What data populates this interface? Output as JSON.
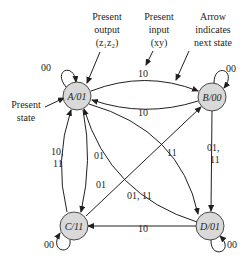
{
  "diagram": {
    "type": "state-diagram",
    "nodes": [
      {
        "id": "A",
        "label": "A/01",
        "state": "A",
        "output": "01"
      },
      {
        "id": "B",
        "label": "B/00",
        "state": "B",
        "output": "00"
      },
      {
        "id": "C",
        "label": "C/11",
        "state": "C",
        "output": "11"
      },
      {
        "id": "D",
        "label": "D/01",
        "state": "D",
        "output": "01"
      }
    ],
    "edges": [
      {
        "from": "A",
        "to": "A",
        "label": "00"
      },
      {
        "from": "A",
        "to": "B",
        "label": "10"
      },
      {
        "from": "B",
        "to": "A",
        "label": "10"
      },
      {
        "from": "B",
        "to": "B",
        "label": "00"
      },
      {
        "from": "B",
        "to": "D",
        "label": "01, 11"
      },
      {
        "from": "A",
        "to": "D",
        "label": "11"
      },
      {
        "from": "D",
        "to": "A",
        "label": "01, 11"
      },
      {
        "from": "A",
        "to": "C",
        "label": "01"
      },
      {
        "from": "C",
        "to": "A",
        "label": "10, 11"
      },
      {
        "from": "C",
        "to": "B",
        "label": "01"
      },
      {
        "from": "C",
        "to": "C",
        "label": "00"
      },
      {
        "from": "D",
        "to": "C",
        "label": "10"
      },
      {
        "from": "D",
        "to": "D",
        "label": "00"
      }
    ],
    "annotations": {
      "present_output": [
        "Present",
        "output",
        "(z₁z₂)"
      ],
      "present_input": [
        "Present",
        "input",
        "(xy)"
      ],
      "arrow_note": [
        "Arrow",
        "indicates",
        "next state"
      ],
      "present_state": [
        "Present",
        "state"
      ]
    },
    "edge_labels": {
      "a_self": "00",
      "a_to_b": "10",
      "b_to_a": "10",
      "b_self": "00",
      "b_to_d_1": "01,",
      "b_to_d_2": "11",
      "a_to_d": "11",
      "d_to_a": "01, 11",
      "a_to_c": "01",
      "c_to_a_1": "10,",
      "c_to_a_2": "11",
      "c_to_b": "01",
      "c_self": "00",
      "d_to_c": "10",
      "d_self": "00"
    },
    "colors": {
      "node_fill": "#d9d9d9",
      "stroke": "#231f20",
      "background": "#ffffff"
    }
  }
}
